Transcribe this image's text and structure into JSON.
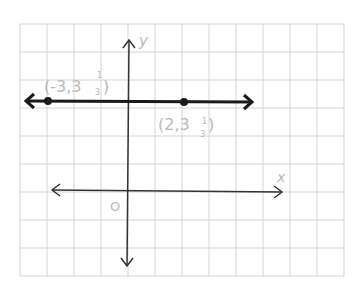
{
  "chart_data": {
    "type": "line",
    "title": "",
    "xlabel": "x",
    "ylabel": "y",
    "origin_label": "O",
    "grid": true,
    "grid_color": "#d4d4d4",
    "line_color": "#1a1a1a",
    "label_color": "#b8b8b8",
    "series": [
      {
        "name": "horizontal line y = 3 1/3",
        "points": [
          {
            "x": -3,
            "y": 3.3333,
            "label": "(-3, 3 1/3)"
          },
          {
            "x": 2,
            "y": 3.3333,
            "label": "(2, 3 1/3)"
          }
        ]
      }
    ],
    "point_labels": [
      {
        "whole": "(-3,3",
        "num": "1",
        "den": "3",
        "close": ")"
      },
      {
        "whole": "(2,3",
        "num": "1",
        "den": "3",
        "close": ")"
      }
    ]
  }
}
